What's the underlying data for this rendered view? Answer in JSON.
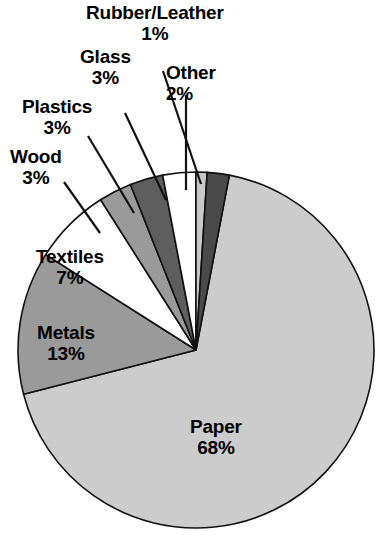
{
  "chart_data": {
    "type": "pie",
    "title": "",
    "subtitle": "",
    "xlabel": "",
    "ylabel": "",
    "units": "percent",
    "legend_position": "none",
    "grid": false,
    "label_format": "name + percent",
    "categories": [
      "Rubber/Leather",
      "Other",
      "Paper",
      "Metals",
      "Textiles",
      "Wood",
      "Plastics",
      "Glass"
    ],
    "values": [
      1,
      2,
      68,
      13,
      7,
      3,
      3,
      3
    ],
    "slices": [
      {
        "name": "Rubber/Leather",
        "percent": 1,
        "percent_text": "1%",
        "color": "#c9c9c9",
        "label_placement": "external",
        "start_angle_deg": 0,
        "end_angle_deg": 3.6
      },
      {
        "name": "Other",
        "percent": 2,
        "percent_text": "2%",
        "color": "#4a4a4a",
        "label_placement": "external",
        "start_angle_deg": 3.6,
        "end_angle_deg": 10.8
      },
      {
        "name": "Paper",
        "percent": 68,
        "percent_text": "68%",
        "color": "#cccccc",
        "label_placement": "internal",
        "start_angle_deg": 10.8,
        "end_angle_deg": 255.6
      },
      {
        "name": "Metals",
        "percent": 13,
        "percent_text": "13%",
        "color": "#9a9a9a",
        "label_placement": "internal",
        "start_angle_deg": 255.6,
        "end_angle_deg": 302.4
      },
      {
        "name": "Textiles",
        "percent": 7,
        "percent_text": "7%",
        "color": "#ffffff",
        "label_placement": "internal",
        "start_angle_deg": 302.4,
        "end_angle_deg": 327.6
      },
      {
        "name": "Wood",
        "percent": 3,
        "percent_text": "3%",
        "color": "#9a9a9a",
        "label_placement": "external",
        "start_angle_deg": 327.6,
        "end_angle_deg": 338.4
      },
      {
        "name": "Plastics",
        "percent": 3,
        "percent_text": "3%",
        "color": "#5e5e5e",
        "label_placement": "external",
        "start_angle_deg": 338.4,
        "end_angle_deg": 349.2
      },
      {
        "name": "Glass",
        "percent": 3,
        "percent_text": "3%",
        "color": "#ffffff",
        "label_placement": "external",
        "start_angle_deg": 349.2,
        "end_angle_deg": 360
      }
    ]
  },
  "geometry": {
    "center_x": 196,
    "center_y": 350,
    "radius": 178
  },
  "style": {
    "outline_color": "#111111",
    "background": "#ffffff",
    "text_color": "#000000"
  }
}
